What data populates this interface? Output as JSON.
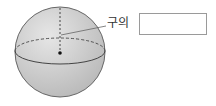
{
  "diagram": {
    "label_text": "구의",
    "answer_box": {
      "value": ""
    },
    "colors": {
      "sphere_fill": "#c9c9c9",
      "outline": "#555555",
      "center_dot": "#111111"
    }
  }
}
